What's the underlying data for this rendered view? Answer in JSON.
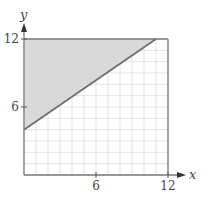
{
  "chart_data": {
    "type": "area",
    "title": "",
    "xlabel": "x",
    "ylabel": "y",
    "xlim": [
      0,
      12
    ],
    "ylim": [
      0,
      12
    ],
    "grid": true,
    "grid_step": 1,
    "x_ticks": [
      6,
      12
    ],
    "y_ticks": [
      6,
      12
    ],
    "x_tick_labels": [
      "6",
      "12"
    ],
    "y_tick_labels": [
      "6",
      "12"
    ],
    "boundary_line": {
      "points": [
        [
          0,
          4
        ],
        [
          11,
          12
        ]
      ],
      "equation": "y = (8/11)x + 4"
    },
    "shaded_region": {
      "description": "region above the line within the square",
      "vertices": [
        [
          0,
          4
        ],
        [
          0,
          12
        ],
        [
          11,
          12
        ]
      ],
      "fill": "#d9d9d9"
    },
    "colors": {
      "grid": "#dcdcdc",
      "axis": "#7a7a7a",
      "line": "#6e6e6e",
      "shade": "#d9d9d9"
    }
  }
}
